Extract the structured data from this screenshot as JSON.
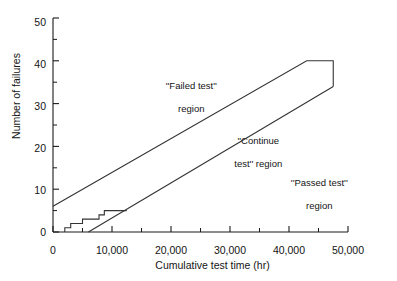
{
  "chart_data": {
    "type": "line",
    "title": "",
    "xlabel": "Cumulative test time (hr)",
    "ylabel": "Number of failures",
    "xlim": [
      0,
      50000
    ],
    "ylim": [
      0,
      50
    ],
    "grid": false,
    "legend": "none",
    "x_ticks_major": [
      0,
      10000,
      20000,
      30000,
      40000,
      50000
    ],
    "x_ticks_major_labels": [
      "0",
      "10,000",
      "20,000",
      "30,000",
      "40,000",
      "50,000"
    ],
    "x_ticks_minor": [
      5000,
      15000,
      25000,
      35000,
      45000
    ],
    "y_ticks_major": [
      0,
      10,
      20,
      30,
      40,
      50
    ],
    "y_ticks_major_labels": [
      "0",
      "10",
      "20",
      "30",
      "40",
      "50"
    ],
    "y_ticks_minor": [
      5,
      15,
      25,
      35,
      45
    ],
    "series": [
      {
        "name": "Upper boundary (reject line)",
        "type": "line",
        "points": [
          [
            0,
            6
          ],
          [
            43000,
            40
          ],
          [
            47500,
            40
          ],
          [
            47500,
            34
          ]
        ]
      },
      {
        "name": "Lower boundary (accept line)",
        "type": "line",
        "points": [
          [
            6000,
            0
          ],
          [
            47500,
            34
          ]
        ]
      },
      {
        "name": "Cumulative failures (step)",
        "type": "step",
        "points": [
          [
            2000,
            0
          ],
          [
            2000,
            1
          ],
          [
            3000,
            1
          ],
          [
            3000,
            2
          ],
          [
            5000,
            2
          ],
          [
            5000,
            3
          ],
          [
            7800,
            3
          ],
          [
            7800,
            4
          ],
          [
            8700,
            4
          ],
          [
            8700,
            5
          ],
          [
            12500,
            5
          ]
        ]
      }
    ],
    "annotations": [
      {
        "name": "failed-test-region",
        "text": "''Failed test''\nregion",
        "x": 17500,
        "y": 36
      },
      {
        "name": "continue-test-region",
        "text": "''Continue\ntest'' region",
        "x": 26000,
        "y": 22
      },
      {
        "name": "passed-test-region",
        "text": "''Passed test''\nregion",
        "x": 36500,
        "y": 15
      }
    ]
  },
  "axes": {
    "y_title": "Number of failures",
    "x_title": "Cumulative test time (hr)",
    "y_labels": [
      "0",
      "10",
      "20",
      "30",
      "40",
      "50"
    ],
    "x_labels": [
      "0",
      "10,000",
      "20,000",
      "30,000",
      "40,000",
      "50,000"
    ]
  },
  "regions": {
    "failed_line1": "''Failed test''",
    "failed_line2": "region",
    "continue_line1": "''Continue",
    "continue_line2": "test'' region",
    "passed_line1": "''Passed test''",
    "passed_line2": "region"
  },
  "colors": {
    "line": "#333333",
    "axis": "#1a1a1a",
    "text": "#141414",
    "background": "#ffffff"
  }
}
